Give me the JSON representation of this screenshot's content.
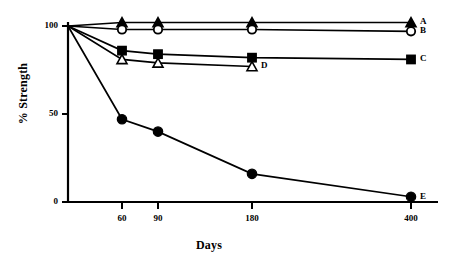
{
  "chart_data": {
    "type": "line",
    "title": "",
    "xlabel": "Days",
    "ylabel": "% Strength",
    "x": [
      0,
      60,
      90,
      180,
      400
    ],
    "xtick_labels": [
      "60",
      "90",
      "180",
      "400"
    ],
    "xtick_values": [
      60,
      90,
      180,
      400
    ],
    "ytick_labels": [
      "0",
      "50",
      "100"
    ],
    "ytick_values": [
      0,
      50,
      100
    ],
    "ylim": [
      0,
      105
    ],
    "grid": false,
    "legend_position": "right-of-line-ends",
    "series": [
      {
        "name": "A",
        "label": "A",
        "marker": "filled-triangle",
        "x": [
          0,
          60,
          90,
          180,
          400
        ],
        "values": [
          100,
          102,
          102,
          102,
          102
        ]
      },
      {
        "name": "B",
        "label": "B",
        "marker": "open-circle",
        "x": [
          0,
          60,
          90,
          180,
          400
        ],
        "values": [
          100,
          98,
          98,
          98,
          97
        ]
      },
      {
        "name": "C",
        "label": "C",
        "marker": "filled-square",
        "x": [
          0,
          60,
          90,
          180,
          400
        ],
        "values": [
          100,
          86,
          84,
          82,
          81
        ]
      },
      {
        "name": "D",
        "label": "D",
        "marker": "open-triangle",
        "x": [
          0,
          60,
          90,
          180
        ],
        "values": [
          100,
          81,
          79,
          77
        ]
      },
      {
        "name": "E",
        "label": "E",
        "marker": "filled-circle",
        "x": [
          0,
          60,
          90,
          180,
          400
        ],
        "values": [
          100,
          47,
          40,
          16,
          3
        ]
      }
    ]
  }
}
